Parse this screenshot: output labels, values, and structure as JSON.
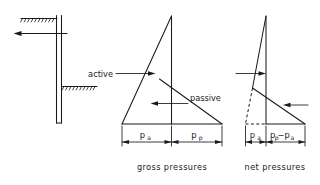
{
  "figure": {
    "title_left": "",
    "panels": [
      {
        "id": "wall-section",
        "caption": "",
        "elements": {
          "wall_label": "",
          "load_arrow": "leftward force arrow at top of wall"
        }
      },
      {
        "id": "gross-pressures",
        "caption": "gross  pressures",
        "labels": {
          "active": "active",
          "passive": "passive"
        },
        "dimensions": [
          {
            "base": "p",
            "sub": "a"
          },
          {
            "base": "p",
            "sub": "p"
          }
        ]
      },
      {
        "id": "net-pressures",
        "caption": "net  pressures",
        "labels": {
          "active": "",
          "passive": ""
        },
        "dimensions": [
          {
            "base": "p",
            "sub": "a"
          },
          {
            "base": "p",
            "sub": "p",
            "base2": "− p",
            "sub2": "a"
          }
        ]
      }
    ]
  },
  "text": {
    "active": "active",
    "passive": "passive",
    "gross_caption": "gross  pressures",
    "net_caption": "net  pressures",
    "pa_base": "p",
    "pa_sub": "a",
    "pp_base": "p",
    "pp_sub": "p",
    "net_right_base": "p",
    "net_right_sub": "p",
    "net_right_minus": "−p",
    "net_right_sub2": "a"
  },
  "colors": {
    "ink": "#1a1a1a",
    "background": "#ffffff"
  }
}
